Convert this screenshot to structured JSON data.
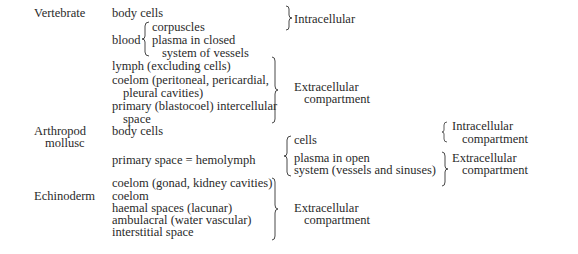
{
  "groups": {
    "vertebrate": {
      "label": "Vertebrate",
      "items": {
        "body_cells": "body cells",
        "blood": "blood",
        "blood_sub": [
          "corpuscles",
          "plasma in closed",
          "system of vessels"
        ],
        "lymph": "lymph (excluding cells)",
        "coelom_1": "coelom (peritoneal, pericardial,",
        "coelom_2": "pleural cavities)",
        "primary_1": "primary (blastocoel) intercellular",
        "primary_2": "space"
      },
      "intracellular": "Intracellular",
      "extracellular_1": "Extracellular",
      "extracellular_2": "compartment"
    },
    "arthropod": {
      "label_1": "Arthropod",
      "label_2": "mollusc",
      "items": {
        "body_cells": "body cells",
        "primary_space": "primary space = hemolymph"
      },
      "hemolymph_sub": {
        "cells": "cells",
        "plasma_1": "plasma in open",
        "plasma_2": "system (vessels and sinuses)"
      },
      "intracellular_1": "Intracellular",
      "intracellular_2": "compartment",
      "extracellular_1": "Extracellular",
      "extracellular_2": "compartment"
    },
    "echinoderm": {
      "label": "Echinoderm",
      "items": [
        "coelom (gonad, kidney cavities)",
        "coelom",
        "haemal spaces (lacunar)",
        "ambulacral (water vascular)",
        "interstitial space"
      ],
      "extracellular_1": "Extracellular",
      "extracellular_2": "compartment"
    }
  }
}
